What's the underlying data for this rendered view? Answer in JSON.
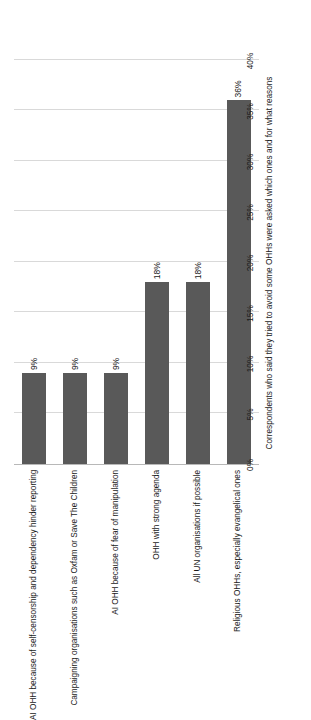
{
  "chart_data": {
    "type": "bar",
    "orientation": "horizontal",
    "title": "",
    "xlabel": "Correspondents who said they tried to avoid some OHHs were asked which ones and for what reasons",
    "ylabel": "",
    "xlim": [
      0,
      40
    ],
    "xticks": [
      "0%",
      "5%",
      "10%",
      "15%",
      "20%",
      "25%",
      "30%",
      "35%",
      "40%"
    ],
    "xtick_values": [
      0,
      5,
      10,
      15,
      20,
      25,
      30,
      35,
      40
    ],
    "grid": true,
    "legend": "none",
    "bar_color": "#595959",
    "categories": [
      "AI OHH because of self-censorship and dependency hinder reporting",
      "Campaigning organisations such as Oxfam or Save The Children",
      "AI OHH because of fear of manipulation",
      "OHH with strong agenda",
      "All UN organisations if possible",
      "Religious OHHs, especially evangelical ones"
    ],
    "values": [
      9,
      9,
      9,
      18,
      18,
      36
    ],
    "data_labels": [
      "9%",
      "9%",
      "9%",
      "18%",
      "18%",
      "36%"
    ]
  }
}
